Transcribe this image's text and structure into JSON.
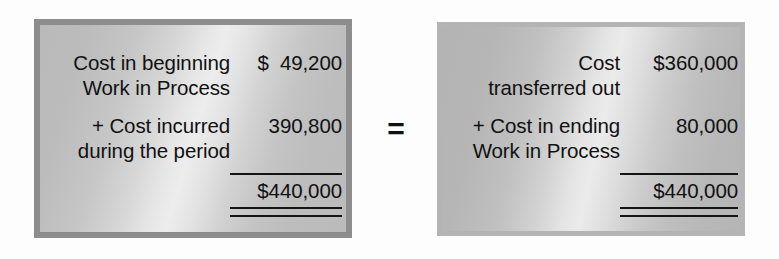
{
  "diagram": {
    "operator": "=",
    "left_box": {
      "rows": [
        {
          "label": "Cost in beginning\nWork in Process",
          "amount": "$  49,200"
        },
        {
          "label": "+ Cost incurred\nduring the period",
          "amount": "390,800"
        }
      ],
      "total": "$440,000"
    },
    "right_box": {
      "rows": [
        {
          "label": "Cost\ntransferred out",
          "amount": "$360,000"
        },
        {
          "label": "+ Cost in ending\nWork in Process",
          "amount": "80,000"
        }
      ],
      "total": "$440,000"
    }
  },
  "colors": {
    "text": "#111111",
    "rule": "#141414",
    "left_frame": "#8d8d8d",
    "right_frame": "#b4b4b4",
    "panel_light": "#ededed",
    "panel_dark": "#b9b9b9",
    "page_background": "#fdfdfd"
  }
}
